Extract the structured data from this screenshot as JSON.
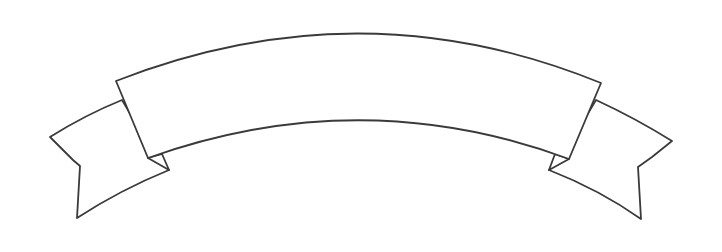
{
  "image": {
    "subject": "curved ribbon banner outline",
    "banner_text": "",
    "colors": {
      "background": "#ffffff",
      "outline": "#3a3a3a",
      "fill": "#ffffff"
    }
  }
}
